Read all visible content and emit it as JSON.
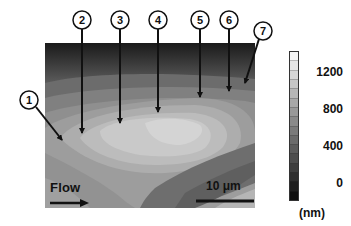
{
  "figure": {
    "type": "height contour map",
    "grayscale": true
  },
  "markers": [
    {
      "label": "1",
      "cx": 29,
      "cy": 100,
      "tipX": 62,
      "tipY": 140
    },
    {
      "label": "2",
      "cx": 82,
      "cy": 20,
      "tipX": 82,
      "tipY": 133
    },
    {
      "label": "3",
      "cx": 120,
      "cy": 20,
      "tipX": 120,
      "tipY": 123
    },
    {
      "label": "4",
      "cx": 158,
      "cy": 20,
      "tipX": 158,
      "tipY": 112
    },
    {
      "label": "5",
      "cx": 200,
      "cy": 20,
      "tipX": 200,
      "tipY": 97
    },
    {
      "label": "6",
      "cx": 229,
      "cy": 20,
      "tipX": 229,
      "tipY": 91
    },
    {
      "label": "7",
      "cx": 263,
      "cy": 31,
      "tipX": 245,
      "tipY": 83
    }
  ],
  "annotations": {
    "flow_label": "Flow",
    "scale_bar_label": "10 μm"
  },
  "colorbar": {
    "ticks": [
      "1200",
      "800",
      "400",
      "0"
    ],
    "unit": "(nm)",
    "range": [
      -150,
      1400
    ],
    "segments": 16
  }
}
